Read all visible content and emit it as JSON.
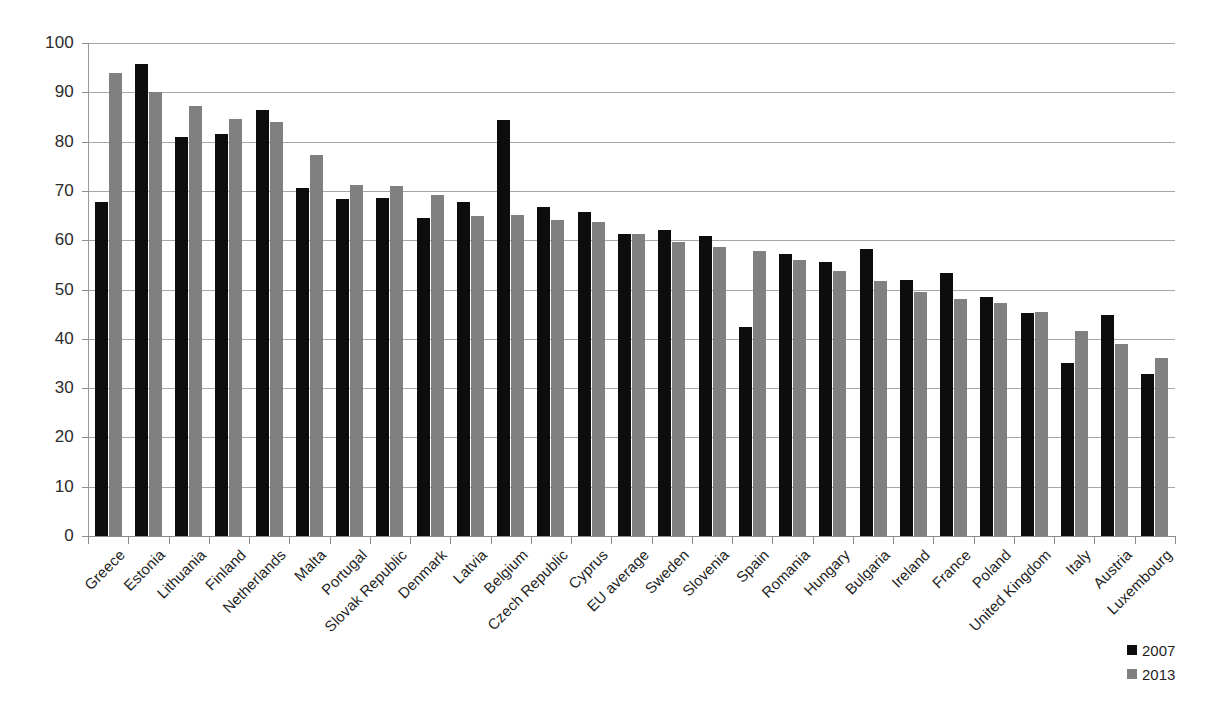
{
  "chart_data": {
    "type": "bar",
    "title": "",
    "subtitle": "",
    "xlabel": "",
    "ylabel": "",
    "ylim": [
      0,
      100
    ],
    "yticks": [
      0,
      10,
      20,
      30,
      40,
      50,
      60,
      70,
      80,
      90,
      100
    ],
    "grid": true,
    "legend_position": "bottom-right",
    "categories": [
      "Greece",
      "Estonia",
      "Lithuania",
      "Finland",
      "Netherlands",
      "Malta",
      "Portugal",
      "Slovak Republic",
      "Denmark",
      "Latvia",
      "Belgium",
      "Czech Republic",
      "Cyprus",
      "EU average",
      "Sweden",
      "Slovenia",
      "Spain",
      "Romania",
      "Hungary",
      "Bulgaria",
      "Ireland",
      "France",
      "Poland",
      "United Kingdom",
      "Italy",
      "Austria",
      "Luxembourg"
    ],
    "series": [
      {
        "name": "2007",
        "color": "#0d0d0d",
        "values": [
          67.7,
          95.7,
          81.0,
          81.5,
          86.5,
          70.5,
          68.3,
          68.5,
          64.5,
          67.8,
          84.4,
          66.7,
          65.8,
          61.2,
          62.1,
          60.8,
          42.3,
          57.2,
          55.5,
          58.2,
          52.0,
          53.4,
          48.4,
          45.3,
          35.0,
          44.9,
          32.8
        ]
      },
      {
        "name": "2013",
        "color": "#808080",
        "values": [
          94.0,
          90.0,
          87.3,
          84.5,
          84.0,
          77.3,
          71.3,
          71.0,
          69.2,
          65.0,
          65.2,
          64.0,
          63.7,
          61.2,
          59.6,
          58.7,
          57.8,
          56.0,
          53.7,
          51.8,
          49.5,
          48.0,
          47.2,
          45.5,
          41.5,
          39.0,
          36.2
        ]
      }
    ]
  },
  "legend": {
    "entries": [
      {
        "label": "2007",
        "color": "#0d0d0d"
      },
      {
        "label": "2013",
        "color": "#808080"
      }
    ]
  }
}
